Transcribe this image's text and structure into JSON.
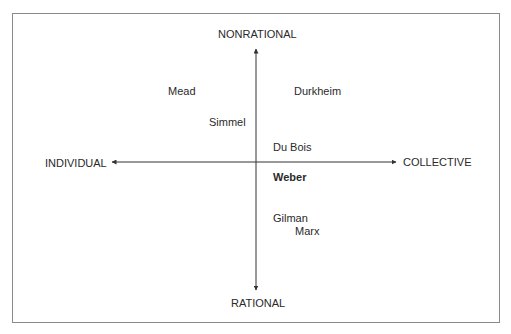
{
  "diagram": {
    "axes": {
      "top": "NONRATIONAL",
      "bottom": "RATIONAL",
      "left": "INDIVIDUAL",
      "right": "COLLECTIVE"
    },
    "theorists": [
      {
        "name": "Mead",
        "quadrant": "individual-nonrational",
        "bold": false
      },
      {
        "name": "Durkheim",
        "quadrant": "collective-nonrational",
        "bold": false
      },
      {
        "name": "Simmel",
        "quadrant": "individual-nonrational",
        "bold": false
      },
      {
        "name": "Du Bois",
        "quadrant": "collective-nonrational",
        "bold": false
      },
      {
        "name": "Weber",
        "quadrant": "collective-rational",
        "bold": true
      },
      {
        "name": "Gilman",
        "quadrant": "collective-rational",
        "bold": false
      },
      {
        "name": "Marx",
        "quadrant": "collective-rational",
        "bold": false
      }
    ],
    "colors": {
      "text": "#2a2a2a",
      "axis": "#333333",
      "frame": "#8a8a8a"
    }
  }
}
